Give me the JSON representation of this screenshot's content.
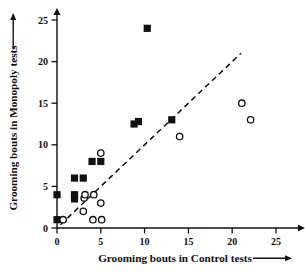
{
  "chart_data": {
    "type": "scatter",
    "title": "",
    "xlabel": "Grooming bouts in Control tests",
    "ylabel": "Grooming bouts in Monopoly tests",
    "xlim": [
      0,
      27.5
    ],
    "ylim": [
      0,
      25.6
    ],
    "xticks": [
      0,
      5,
      10,
      15,
      20,
      25
    ],
    "yticks": [
      0,
      5,
      10,
      15,
      20,
      25
    ],
    "xtick_labels": [
      "0",
      "5",
      "10",
      "15",
      "20",
      "25"
    ],
    "ytick_labels": [
      "0",
      "5",
      "10",
      "15",
      "20",
      "25"
    ],
    "grid": false,
    "legend": null,
    "legend_position": "none",
    "annotations": [
      {
        "name": "identity-line",
        "type": "dashed-line",
        "description": "dashed line of equality y = x",
        "from": [
          0.4,
          0.4
        ],
        "to": [
          21.0,
          21.0
        ]
      }
    ],
    "series": [
      {
        "name": "filled-squares",
        "marker": "filled-square",
        "color": "#111111",
        "points": [
          [
            0.0,
            1.0
          ],
          [
            0.0,
            4.0
          ],
          [
            2.0,
            3.5
          ],
          [
            2.0,
            4.0
          ],
          [
            2.0,
            6.0
          ],
          [
            3.0,
            6.0
          ],
          [
            4.0,
            8.0
          ],
          [
            5.0,
            8.0
          ],
          [
            8.8,
            12.5
          ],
          [
            9.3,
            12.8
          ],
          [
            10.3,
            24.0
          ],
          [
            13.1,
            13.0
          ]
        ]
      },
      {
        "name": "open-circles",
        "marker": "open-circle",
        "color": "#111111",
        "points": [
          [
            0.7,
            1.0
          ],
          [
            3.0,
            2.0
          ],
          [
            3.1,
            3.6
          ],
          [
            3.2,
            4.0
          ],
          [
            4.1,
            1.0
          ],
          [
            4.2,
            4.0
          ],
          [
            5.0,
            3.0
          ],
          [
            5.1,
            1.0
          ],
          [
            5.0,
            9.0
          ],
          [
            14.0,
            11.0
          ],
          [
            21.1,
            15.0
          ],
          [
            22.1,
            13.0
          ]
        ]
      }
    ]
  },
  "axes": {
    "x_axis_arrow": "right-arrow-icon",
    "y_axis_arrow": "up-arrow-icon"
  }
}
